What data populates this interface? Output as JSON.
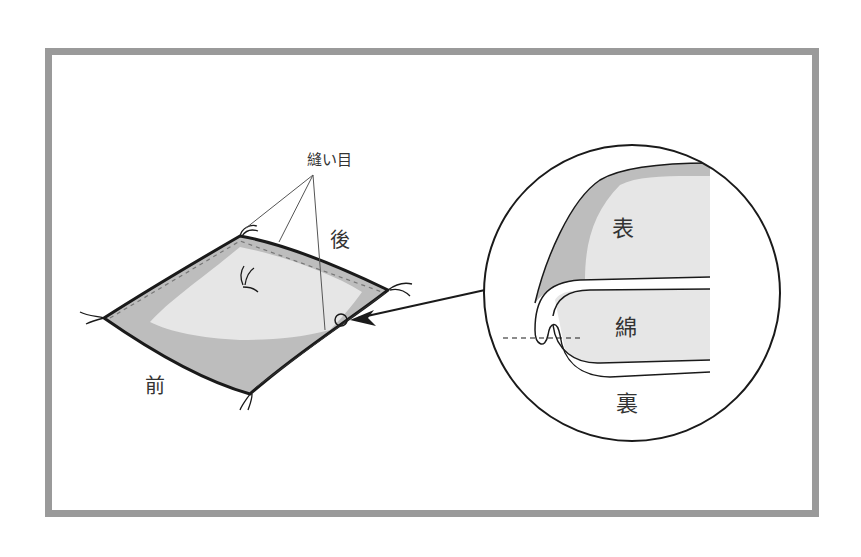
{
  "diagram": {
    "type": "illustration",
    "labels": {
      "seam": "縫い目",
      "back": "後",
      "front": "前",
      "face_fabric": "表",
      "cotton_filling": "綿",
      "back_fabric": "裏"
    },
    "colors": {
      "frame": "#9a9a9a",
      "outline": "#1a1a1a",
      "fabric_dark": "#bdbdbd",
      "fabric_light": "#e6e6e6",
      "background": "#ffffff"
    }
  }
}
